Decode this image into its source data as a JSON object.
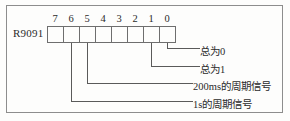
{
  "diagram": {
    "register_label": "R9091",
    "bit_numbers": [
      "7",
      "6",
      "5",
      "4",
      "3",
      "2",
      "1",
      "0"
    ],
    "bit_values": [
      "",
      "",
      "",
      "",
      "",
      "",
      "",
      ""
    ],
    "annotations": [
      {
        "bit": "0",
        "text": "总为0"
      },
      {
        "bit": "1",
        "text": "总为1"
      },
      {
        "bit": "5",
        "text": "200ms的周期信号"
      },
      {
        "bit": "6",
        "text": "1s的周期信号"
      }
    ],
    "colors": {
      "border": "#8d8d8d",
      "line": "#555555",
      "text": "#2b2b2b",
      "background": "#fdfdfc"
    }
  }
}
